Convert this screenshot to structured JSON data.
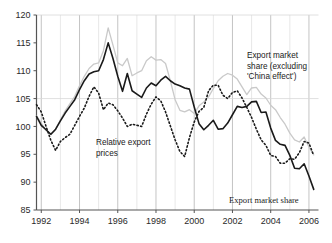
{
  "chart_data": {
    "type": "line",
    "title": "",
    "xlabel": "",
    "ylabel": "",
    "xlim": [
      1991.75,
      2006.5
    ],
    "ylim": [
      85,
      120
    ],
    "yticks": [
      85,
      90,
      95,
      100,
      105,
      110,
      115,
      120
    ],
    "xticks": [
      1992,
      1994,
      1996,
      1998,
      2000,
      2002,
      2004,
      2006
    ],
    "xtick_labels": [
      "1992",
      "1994",
      "1996",
      "1998",
      "2000",
      "2002",
      "2004",
      "2006"
    ],
    "ytick_labels": [
      "85",
      "90",
      "95",
      "100",
      "105",
      "110",
      "115",
      "120"
    ],
    "grid": "vertical-yearly-plus-horizontal-at-105-and-120",
    "legend_position": "inline-annotations",
    "frequency": "quarterly",
    "x": [
      1991.75,
      1992.0,
      1992.25,
      1992.5,
      1992.75,
      1993.0,
      1993.25,
      1993.5,
      1993.75,
      1994.0,
      1994.25,
      1994.5,
      1994.75,
      1995.0,
      1995.25,
      1995.5,
      1995.75,
      1996.0,
      1996.25,
      1996.5,
      1996.75,
      1997.0,
      1997.25,
      1997.5,
      1997.75,
      1998.0,
      1998.25,
      1998.5,
      1998.75,
      1999.0,
      1999.25,
      1999.5,
      1999.75,
      2000.0,
      2000.25,
      2000.5,
      2000.75,
      2001.0,
      2001.25,
      2001.5,
      2001.75,
      2002.0,
      2002.25,
      2002.5,
      2002.75,
      2003.0,
      2003.25,
      2003.5,
      2003.75,
      2004.0,
      2004.25,
      2004.5,
      2004.75,
      2005.0,
      2005.25,
      2005.5,
      2005.75,
      2006.0,
      2006.25
    ],
    "series": [
      {
        "name": "Export market share",
        "style": "solid",
        "color": "#1a1a1a",
        "width": 1.6,
        "values": [
          101.8,
          100.2,
          99.4,
          98.6,
          99.5,
          101.0,
          102.4,
          103.6,
          104.8,
          106.6,
          108.2,
          109.4,
          109.8,
          110.0,
          112.0,
          115.0,
          112.2,
          109.0,
          106.3,
          109.5,
          106.4,
          105.8,
          105.2,
          106.9,
          107.8,
          107.3,
          108.3,
          109.0,
          108.2,
          107.6,
          107.3,
          106.9,
          106.7,
          103.5,
          100.5,
          99.4,
          100.2,
          101.1,
          99.5,
          99.6,
          100.6,
          102.1,
          103.6,
          103.4,
          103.6,
          104.4,
          104.5,
          102.5,
          102.6,
          99.7,
          97.5,
          96.8,
          96.6,
          94.8,
          92.5,
          92.4,
          93.3,
          91.1,
          88.7
        ]
      },
      {
        "name": "Export market share (excluding 'China effect')",
        "style": "solid",
        "color": "#c9c9c9",
        "width": 1.3,
        "values": [
          101.9,
          100.6,
          99.3,
          98.5,
          99.4,
          101.2,
          102.8,
          104.1,
          105.4,
          107.3,
          109.0,
          110.4,
          111.2,
          111.4,
          113.6,
          117.7,
          114.6,
          111.4,
          110.9,
          112.2,
          109.1,
          109.6,
          110.0,
          111.8,
          112.5,
          111.9,
          112.0,
          111.3,
          108.2,
          104.8,
          102.9,
          102.6,
          103.0,
          102.3,
          103.7,
          104.4,
          105.3,
          106.8,
          108.2,
          109.0,
          109.5,
          109.2,
          108.5,
          107.1,
          105.7,
          106.9,
          107.0,
          105.8,
          105.1,
          103.8,
          103.0,
          101.6,
          100.4,
          98.8,
          97.6,
          97.2,
          98.1,
          96.3,
          94.9
        ]
      },
      {
        "name": "Relative export prices",
        "style": "dotted",
        "color": "#1a1a1a",
        "width": 1.6,
        "values": [
          103.9,
          102.6,
          100.0,
          97.5,
          95.7,
          97.3,
          98.0,
          98.6,
          100.2,
          101.8,
          103.3,
          105.4,
          107.1,
          106.0,
          103.0,
          104.2,
          103.9,
          102.8,
          101.5,
          100.0,
          100.4,
          100.2,
          100.0,
          102.2,
          104.0,
          105.3,
          104.6,
          102.6,
          100.1,
          97.6,
          95.5,
          94.6,
          98.0,
          100.8,
          102.7,
          103.4,
          106.4,
          107.4,
          107.4,
          105.6,
          105.0,
          106.1,
          106.4,
          105.1,
          103.4,
          101.6,
          99.5,
          97.6,
          96.6,
          94.8,
          94.6,
          93.4,
          93.4,
          94.2,
          94.1,
          95.3,
          97.3,
          97.0,
          94.8
        ]
      }
    ],
    "annotations": [
      {
        "name": "export-market-share-excluding-china-label",
        "lines": [
          "Export market",
          "share (excluding",
          "'China effect')"
        ],
        "x_px": 247,
        "y_px": 58
      },
      {
        "name": "relative-export-prices-label",
        "lines": [
          "Relative export",
          "prices"
        ],
        "x_px": 96,
        "y_px": 145
      },
      {
        "name": "export-market-share-label",
        "lines": [
          "Export market share"
        ],
        "x_px": 229,
        "y_px": 203
      }
    ]
  },
  "colors": {
    "axis": "#555555",
    "grid_minor": "#d8d8d8",
    "grid_major": "#bdbdbd",
    "grid_h": "#d8d8d8",
    "series_black": "#1a1a1a",
    "series_grey": "#c9c9c9",
    "background": "#ffffff"
  }
}
